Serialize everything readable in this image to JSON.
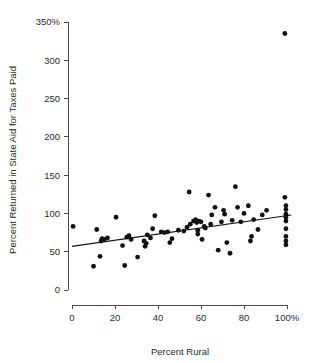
{
  "chart_data": {
    "type": "scatter",
    "title": "",
    "xlabel": "Percent Rural",
    "ylabel": "Percent Returned in State Aid for Taxes Paid",
    "xlim": [
      0,
      100
    ],
    "ylim": [
      0,
      350
    ],
    "grid": false,
    "legend": "none",
    "xticks": [
      0,
      20,
      40,
      60,
      80,
      100
    ],
    "xticklabels": [
      "0",
      "20",
      "40",
      "60",
      "80",
      "100%"
    ],
    "yticks": [
      0,
      50,
      100,
      150,
      200,
      250,
      300,
      350
    ],
    "yticklabels": [
      "0",
      "50",
      "100",
      "150",
      "200",
      "250",
      "300",
      "350%"
    ],
    "marker": "filled-circle",
    "marker_color": "#111111",
    "points": [
      {
        "x": 0.5,
        "y": 83
      },
      {
        "x": 10.0,
        "y": 31
      },
      {
        "x": 11.5,
        "y": 79
      },
      {
        "x": 13.0,
        "y": 44
      },
      {
        "x": 13.5,
        "y": 64
      },
      {
        "x": 14.0,
        "y": 67
      },
      {
        "x": 15.0,
        "y": 66
      },
      {
        "x": 16.5,
        "y": 68
      },
      {
        "x": 20.5,
        "y": 95
      },
      {
        "x": 23.5,
        "y": 58
      },
      {
        "x": 24.5,
        "y": 32
      },
      {
        "x": 25.5,
        "y": 69
      },
      {
        "x": 26.5,
        "y": 71
      },
      {
        "x": 27.5,
        "y": 66
      },
      {
        "x": 30.5,
        "y": 43
      },
      {
        "x": 33.5,
        "y": 64
      },
      {
        "x": 34.0,
        "y": 57
      },
      {
        "x": 34.5,
        "y": 61
      },
      {
        "x": 35.0,
        "y": 72
      },
      {
        "x": 36.5,
        "y": 68
      },
      {
        "x": 37.5,
        "y": 80
      },
      {
        "x": 38.5,
        "y": 97
      },
      {
        "x": 41.5,
        "y": 76
      },
      {
        "x": 43.0,
        "y": 75
      },
      {
        "x": 44.5,
        "y": 76
      },
      {
        "x": 45.5,
        "y": 62
      },
      {
        "x": 46.5,
        "y": 67
      },
      {
        "x": 49.5,
        "y": 78
      },
      {
        "x": 52.0,
        "y": 77
      },
      {
        "x": 53.5,
        "y": 82
      },
      {
        "x": 54.5,
        "y": 128
      },
      {
        "x": 55.0,
        "y": 86
      },
      {
        "x": 56.5,
        "y": 90
      },
      {
        "x": 57.5,
        "y": 92
      },
      {
        "x": 58.0,
        "y": 88
      },
      {
        "x": 58.5,
        "y": 73
      },
      {
        "x": 58.5,
        "y": 78
      },
      {
        "x": 59.0,
        "y": 90
      },
      {
        "x": 60.0,
        "y": 89
      },
      {
        "x": 60.5,
        "y": 66
      },
      {
        "x": 61.5,
        "y": 83
      },
      {
        "x": 62.0,
        "y": 81
      },
      {
        "x": 63.5,
        "y": 124
      },
      {
        "x": 64.5,
        "y": 86
      },
      {
        "x": 65.0,
        "y": 98
      },
      {
        "x": 66.5,
        "y": 108
      },
      {
        "x": 68.0,
        "y": 52
      },
      {
        "x": 69.5,
        "y": 89
      },
      {
        "x": 70.5,
        "y": 104
      },
      {
        "x": 71.0,
        "y": 99
      },
      {
        "x": 72.0,
        "y": 62
      },
      {
        "x": 73.5,
        "y": 48
      },
      {
        "x": 74.5,
        "y": 91
      },
      {
        "x": 76.0,
        "y": 135
      },
      {
        "x": 77.0,
        "y": 108
      },
      {
        "x": 78.5,
        "y": 89
      },
      {
        "x": 80.0,
        "y": 100
      },
      {
        "x": 82.0,
        "y": 110
      },
      {
        "x": 83.0,
        "y": 64
      },
      {
        "x": 83.5,
        "y": 70
      },
      {
        "x": 84.5,
        "y": 92
      },
      {
        "x": 86.5,
        "y": 79
      },
      {
        "x": 88.5,
        "y": 98
      },
      {
        "x": 90.5,
        "y": 104
      },
      {
        "x": 99.0,
        "y": 121
      },
      {
        "x": 99.5,
        "y": 110
      },
      {
        "x": 99.5,
        "y": 105
      },
      {
        "x": 99.5,
        "y": 99
      },
      {
        "x": 99.5,
        "y": 95
      },
      {
        "x": 99.5,
        "y": 90
      },
      {
        "x": 99.5,
        "y": 80
      },
      {
        "x": 99.5,
        "y": 70
      },
      {
        "x": 99.5,
        "y": 64
      },
      {
        "x": 99.5,
        "y": 59
      },
      {
        "x": 99.0,
        "y": 335
      }
    ],
    "fit_line": {
      "type": "linear-regression",
      "x_start": 0,
      "y_start": 57,
      "x_end": 102,
      "y_end": 98
    }
  },
  "axes": {
    "x_axis_name": "percent-rural-axis",
    "y_axis_name": "percent-returned-axis"
  }
}
